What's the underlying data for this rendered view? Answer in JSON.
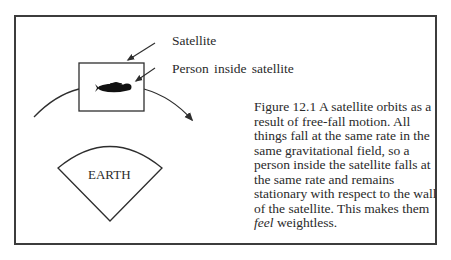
{
  "diagram": {
    "labels": {
      "satellite": "Satellite",
      "person": "Person inside satellite",
      "earth": "EARTH"
    },
    "caption": {
      "lines": [
        {
          "text": "Figure 12.1 A satellite orbits as a",
          "justified": true
        },
        {
          "text": "result of free-fall motion. All",
          "justified": false
        },
        {
          "text": "things fall at the same rate in the",
          "justified": true
        },
        {
          "text": "same gravitational field, so a",
          "justified": false
        },
        {
          "text": "person inside the satellite falls at",
          "justified": true
        },
        {
          "text": "the same rate and remains",
          "justified": false
        },
        {
          "text": "stationary with respect to the wall",
          "justified": true
        },
        {
          "text": "of the satellite. This makes them",
          "justified": true
        }
      ],
      "last_line_italic": "feel",
      "last_line_rest": " weightless."
    },
    "colors": {
      "stroke": "#2e2e2e",
      "text": "#2a2a2a",
      "background": "#ffffff"
    }
  }
}
